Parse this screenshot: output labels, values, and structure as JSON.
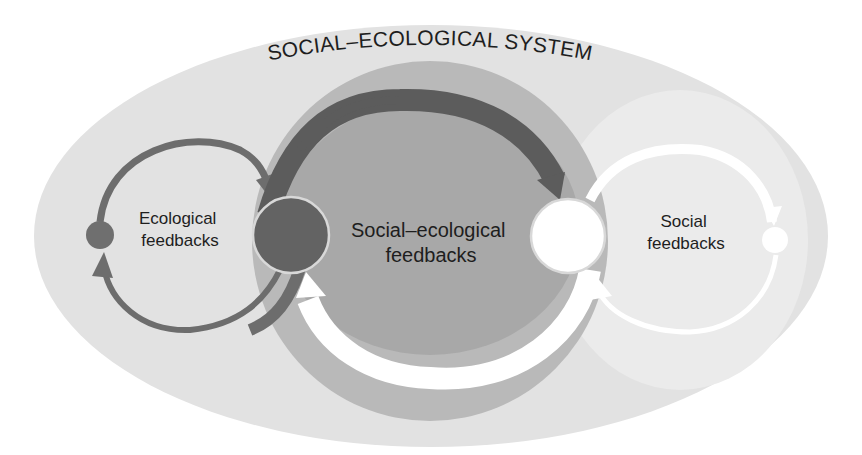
{
  "diagram": {
    "title": "SOCIAL–ECOLOGICAL SYSTEM",
    "regions": {
      "ecological": {
        "label_line1": "Ecological",
        "label_line2": "feedbacks"
      },
      "social_ecological": {
        "label_line1": "Social–ecological",
        "label_line2": "feedbacks"
      },
      "social": {
        "label_line1": "Social",
        "label_line2": "feedbacks"
      }
    },
    "nodes": [
      {
        "id": "ecological-small-node",
        "fill": "#6f6f6f"
      },
      {
        "id": "ecological-node",
        "fill": "#636363"
      },
      {
        "id": "social-node",
        "fill": "#ffffff"
      },
      {
        "id": "social-small-node",
        "fill": "#ffffff"
      }
    ],
    "colors": {
      "background": "#ffffff",
      "system_ellipse": "#e2e2e2",
      "social_region": "#ebebeb",
      "outer_ring": "#b9b9b9",
      "inner_disc": "#a8a8a8",
      "ecological_arrow": "#6d6d6d",
      "dark_arrow": "#5c5c5c",
      "white_arrow": "#ffffff",
      "node_outline": "#d8d8d8",
      "text": "#1e1e1e"
    }
  }
}
